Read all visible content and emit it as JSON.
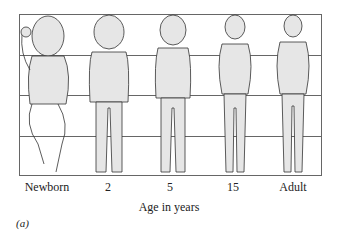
{
  "figure": {
    "panel_label": "(a)",
    "axis_label": "Age in years",
    "stages": [
      {
        "label": "Newborn",
        "head_fraction": 0.25
      },
      {
        "label": "2",
        "head_fraction": 0.2
      },
      {
        "label": "5",
        "head_fraction": 0.167
      },
      {
        "label": "15",
        "head_fraction": 0.143
      },
      {
        "label": "Adult",
        "head_fraction": 0.125
      }
    ],
    "colors": {
      "skin": "#e6e6e6",
      "outline": "#333333",
      "grid": "#666666"
    }
  }
}
